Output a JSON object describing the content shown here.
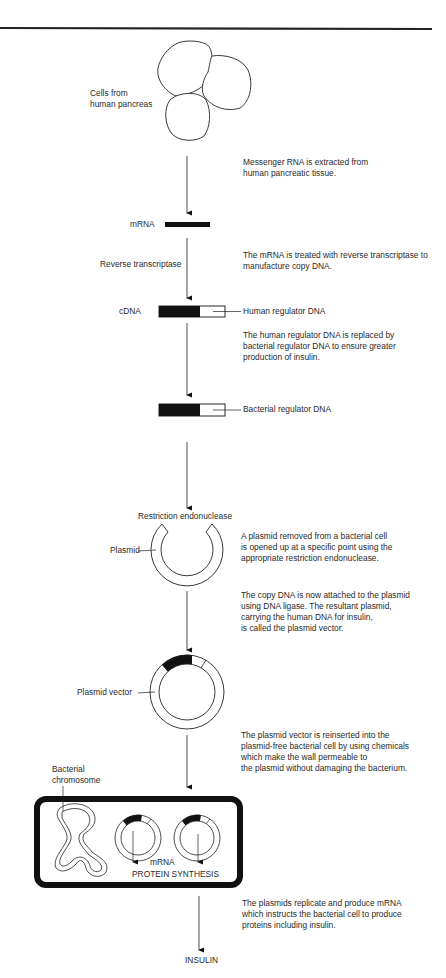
{
  "diagram": {
    "steps": [
      {
        "id": "cells",
        "label": "Cells from human pancreas",
        "label_lines": [
          "Cells from",
          "human pancreas"
        ],
        "description_lines": [
          "Messenger RNA is extracted from",
          "human pancreatic tissue."
        ]
      },
      {
        "id": "mrna",
        "label": "mRNA",
        "side_label": "Reverse transcriptase",
        "description_lines": [
          "The mRNA is treated with reverse transcriptase to",
          "manufacture copy DNA."
        ]
      },
      {
        "id": "cdna",
        "label": "cDNA",
        "callout": "Human regulator DNA",
        "description_lines": [
          "The human regulator DNA is replaced by",
          "bacterial regulator DNA to ensure greater",
          "production of insulin."
        ]
      },
      {
        "id": "modified-dna",
        "callout": "Bacterial regulator DNA"
      },
      {
        "id": "plasmid",
        "label": "Plasmid",
        "above_label": "Restriction endonuclease",
        "description_lines": [
          "A plasmid removed from a bacterial cell",
          "is opened up at a specific point using the",
          "appropriate restriction endonuclease."
        ]
      },
      {
        "id": "plasmid-vector",
        "label": "Plasmid vector",
        "description_lines_before": [
          "The copy DNA is now attached to the plasmid",
          "using DNA ligase.  The resultant plasmid,",
          "carrying the human DNA for insulin,",
          " is called the plasmid vector."
        ],
        "description_lines": [
          "The plasmid vector is reinserted into the",
          "plasmid-free bacterial cell by using chemicals",
          "which make the wall permeable to",
          "the plasmid without damaging the bacterium."
        ]
      },
      {
        "id": "bacterium",
        "chromosome_label_lines": [
          "Bacterial",
          "chromosome"
        ],
        "mrna_label": "mRNA",
        "synthesis_label": "PROTEIN SYNTHESIS",
        "description_lines": [
          "The plasmids replicate and produce mRNA",
          "which instructs the bacterial cell to produce",
          "proteins including insulin."
        ]
      },
      {
        "id": "insulin",
        "label": "INSULIN"
      }
    ]
  },
  "colors": {
    "ink": "#111111",
    "text": "#2a2a2a",
    "background": "#ffffff"
  }
}
